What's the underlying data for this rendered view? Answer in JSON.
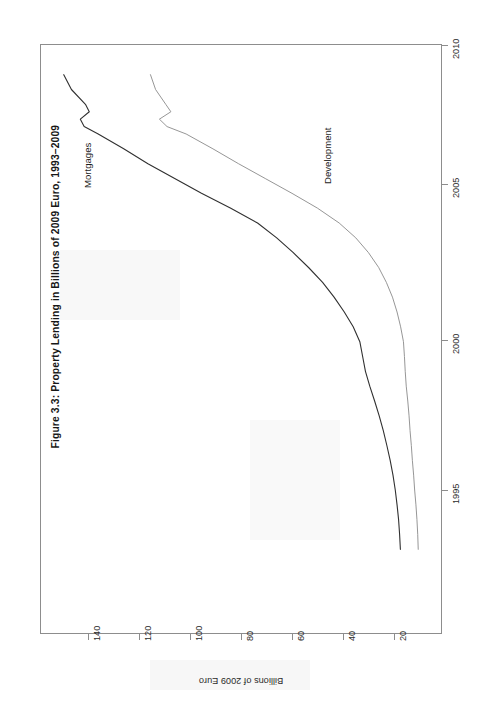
{
  "figure": {
    "title": "Figure 3.3: Property Lending in Billions of 2009 Euro, 1993–2009",
    "orientation": "rotated-90-ccw",
    "frame_color": "#8d8d8d",
    "background": "#ffffff"
  },
  "chart_data": {
    "type": "line",
    "title": "Figure 3.3: Property Lending in Billions of 2009 Euro, 1993–2009",
    "xlabel": "",
    "ylabel": "Billions of 2009 Euro",
    "xlim": [
      1993,
      2010
    ],
    "ylim": [
      0,
      152
    ],
    "grid": false,
    "legend": "in-plot annotations",
    "x_tick_labels": [
      "1995",
      "2000",
      "2005",
      "2010"
    ],
    "x_ticks": [
      1995,
      2000,
      2005,
      2010
    ],
    "y_tick_labels": [
      "20",
      "40",
      "60",
      "80",
      "100",
      "120",
      "140"
    ],
    "y_ticks": [
      20,
      40,
      60,
      80,
      100,
      120,
      140
    ],
    "x": [
      1993.0,
      1993.5,
      1994.0,
      1994.5,
      1995.0,
      1995.5,
      1996.0,
      1996.5,
      1997.0,
      1997.5,
      1998.0,
      1998.5,
      1999.0,
      1999.5,
      2000.0,
      2000.5,
      2001.0,
      2001.5,
      2002.0,
      2002.5,
      2003.0,
      2003.5,
      2004.0,
      2004.5,
      2005.0,
      2005.5,
      2006.0,
      2006.5,
      2007.0,
      2007.25,
      2007.5,
      2007.75,
      2008.0,
      2008.5,
      2009.0
    ],
    "series": [
      {
        "name": "Mortgages",
        "color": "#303030",
        "width": 1.1,
        "values": [
          17.5,
          17.8,
          18.2,
          18.8,
          19.5,
          20.4,
          21.5,
          22.8,
          24.2,
          25.8,
          27.6,
          29.5,
          31.2,
          32.3,
          33.4,
          36.0,
          39.5,
          43.5,
          48.0,
          53.5,
          59.5,
          66.0,
          73.5,
          84.0,
          95.5,
          106.0,
          116.5,
          126.0,
          136.0,
          141.5,
          143.0,
          139.5,
          141.0,
          146.5,
          149.5
        ]
      },
      {
        "name": "Development",
        "color": "#8a8a8a",
        "width": 0.9,
        "values": [
          10.5,
          10.7,
          11.0,
          11.4,
          11.9,
          12.3,
          12.8,
          13.2,
          13.7,
          14.1,
          14.6,
          15.2,
          15.6,
          15.9,
          16.3,
          17.4,
          18.8,
          20.6,
          23.0,
          26.0,
          30.0,
          35.0,
          41.5,
          50.0,
          60.0,
          70.5,
          81.0,
          91.0,
          101.5,
          109.0,
          112.0,
          107.5,
          109.5,
          113.5,
          115.5
        ]
      }
    ],
    "annotations": [
      {
        "text": "Mortgages",
        "at_x": 2008.1,
        "at_y": 128.0
      },
      {
        "text": "Development",
        "at_x": 2005.2,
        "at_y": 58.0
      }
    ]
  },
  "value_axis": {
    "title": "Billions of 2009 Euro",
    "ticks": [
      {
        "label": "140",
        "px": 88
      },
      {
        "label": "120",
        "px": 139
      },
      {
        "label": "100",
        "px": 190
      },
      {
        "label": "80",
        "px": 241
      },
      {
        "label": "60",
        "px": 292
      },
      {
        "label": "40",
        "px": 343
      },
      {
        "label": "20",
        "px": 394
      }
    ]
  },
  "time_axis": {
    "ticks": [
      {
        "label": "2010",
        "px": 45
      },
      {
        "label": "2005",
        "px": 184
      },
      {
        "label": "2000",
        "px": 340
      },
      {
        "label": "1995",
        "px": 490
      }
    ]
  },
  "series_labels": [
    {
      "name": "Mortgages",
      "left": 82,
      "top": 188
    },
    {
      "name": "Development",
      "left": 322,
      "top": 184
    }
  ]
}
